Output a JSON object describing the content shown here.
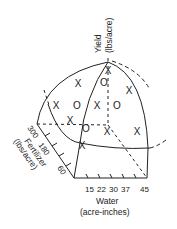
{
  "figure": {
    "type": "3d-response-surface-diagram",
    "axes": {
      "yield": {
        "label_line1": "Yield",
        "label_line2": "(lbs/acre)"
      },
      "fertilizer": {
        "label_line1": "Fertilizer",
        "label_line2": "(lbs/acre)",
        "ticks": [
          "300",
          "180",
          "60"
        ]
      },
      "water": {
        "label_line1": "Water",
        "label_line2": "(acre-inches)",
        "ticks": [
          "15",
          "22",
          "30",
          "37",
          "45"
        ]
      }
    },
    "markers": {
      "x_symbol": "X",
      "o_symbol": "O",
      "points": [
        {
          "symbol": "X",
          "x": 108,
          "y": 70
        },
        {
          "symbol": "O",
          "x": 104,
          "y": 82
        },
        {
          "symbol": "X",
          "x": 78,
          "y": 83
        },
        {
          "symbol": "X",
          "x": 129,
          "y": 90
        },
        {
          "symbol": "X",
          "x": 56,
          "y": 105
        },
        {
          "symbol": "O",
          "x": 77,
          "y": 105
        },
        {
          "symbol": "X",
          "x": 97,
          "y": 105
        },
        {
          "symbol": "O",
          "x": 117,
          "y": 105
        },
        {
          "symbol": "X",
          "x": 70,
          "y": 120
        },
        {
          "symbol": "O",
          "x": 86,
          "y": 128
        },
        {
          "symbol": "X",
          "x": 107,
          "y": 131
        },
        {
          "symbol": "X",
          "x": 137,
          "y": 131
        },
        {
          "symbol": "X",
          "x": 82,
          "y": 145
        }
      ]
    },
    "colors": {
      "ink": "#222222",
      "background": "#ffffff"
    }
  }
}
